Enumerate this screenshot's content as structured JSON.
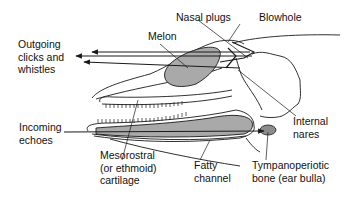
{
  "diagram": {
    "colors": {
      "outline": "#1a1a1a",
      "fat_fill": "#a9a9a9",
      "bulla_fill": "#8c8c8c",
      "background": "#ffffff"
    },
    "labels": {
      "outgoing": "Outgoing\nclicks and\nwhistles",
      "melon": "Melon",
      "nasal_plugs": "Nasal plugs",
      "blowhole": "Blowhole",
      "incoming": "Incoming\nechoes",
      "mesorostral": "Mesorostral\n(or ethmoid)\ncartilage",
      "fatty_channel": "Fatty\nchannel",
      "tympanoperiotic": "Tympanoperiotic\nbone (ear bulla)",
      "internal_nares": "Internal\nnares"
    }
  }
}
